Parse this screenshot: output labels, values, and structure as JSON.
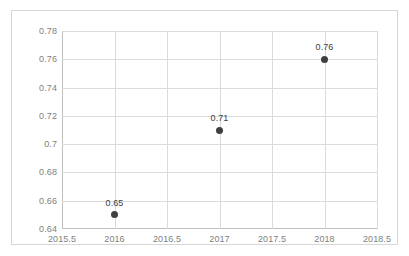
{
  "chart_data": {
    "type": "scatter",
    "title": "",
    "subtitle": "",
    "xlabel": "",
    "ylabel": "",
    "x": [
      2016,
      2017,
      2018
    ],
    "values": [
      0.65,
      0.71,
      0.76
    ],
    "point_labels": [
      "0.65",
      "0.71",
      "0.76"
    ],
    "xlim": [
      2015.5,
      2018.5
    ],
    "ylim": [
      0.64,
      0.78
    ],
    "x_ticks": [
      2015.5,
      2016,
      2016.5,
      2017,
      2017.5,
      2018,
      2018.5
    ],
    "x_tick_labels": [
      "2015.5",
      "2016",
      "2016.5",
      "2017",
      "2017.5",
      "2018",
      "2018.5"
    ],
    "y_ticks": [
      0.64,
      0.66,
      0.68,
      0.7,
      0.72,
      0.74,
      0.76,
      0.78
    ],
    "y_tick_labels": [
      "0.64",
      "0.66",
      "0.68",
      "0.7",
      "0.72",
      "0.74",
      "0.76",
      "0.78"
    ],
    "grid": {
      "horizontal": true,
      "vertical": true,
      "color": "#dadada"
    },
    "legend": {
      "visible": false,
      "position": "none",
      "entries": []
    },
    "series": [
      {
        "name": "",
        "marker": "circle",
        "marker_color": "#3f3f3f",
        "points": [
          {
            "x": 2016,
            "y": 0.65,
            "label": "0.65"
          },
          {
            "x": 2017,
            "y": 0.71,
            "label": "0.71"
          },
          {
            "x": 2018,
            "y": 0.76,
            "label": "0.76"
          }
        ]
      }
    ],
    "colors": {
      "marker": "#3f3f3f",
      "gridline": "#dadada",
      "axis_line": "#bfbfbf",
      "frame_border": "#d6d6d6",
      "tick_text": "#808080",
      "label_text": "#404040",
      "background": "#ffffff"
    }
  }
}
